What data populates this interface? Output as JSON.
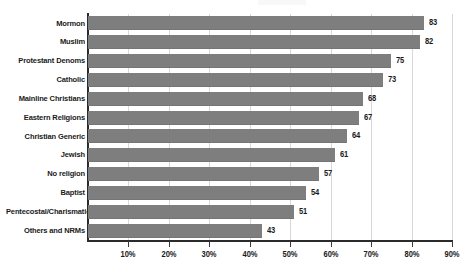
{
  "chart_data": {
    "type": "bar",
    "orientation": "horizontal",
    "title": "",
    "subtitle": "",
    "xlabel": "",
    "ylabel": "",
    "xlim": [
      0,
      90
    ],
    "grid": true,
    "legend": "none",
    "value_suffix": "",
    "categories": [
      "Mormon",
      "Muslim",
      "Protestant Denoms",
      "Catholic",
      "Mainline Christians",
      "Eastern Religions",
      "Christian Generic",
      "Jewish",
      "No  religion",
      "Baptist",
      "Pentecostal/Charismatic",
      "Others and NRMs"
    ],
    "values": [
      83,
      82,
      75,
      73,
      68,
      67,
      64,
      61,
      57,
      54,
      51,
      43
    ],
    "value_labels": [
      "83",
      "82",
      "75",
      "73",
      "68",
      "67",
      "64",
      "61",
      "57",
      "54",
      "51",
      "43"
    ],
    "xticks": [
      10,
      20,
      30,
      40,
      50,
      60,
      70,
      80,
      90
    ],
    "xtick_labels": [
      "10%",
      "20%",
      "30%",
      "40%",
      "50%",
      "60%",
      "70%",
      "80%",
      "90%"
    ],
    "colors": {
      "bar": "#7e7e7e",
      "axis": "#2b2b2b",
      "grid": "#d8d8d8",
      "text": "#1a1a1a",
      "background": "#ffffff"
    }
  }
}
